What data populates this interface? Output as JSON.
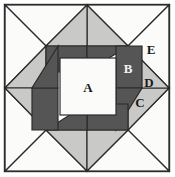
{
  "figure": {
    "name": "quilt-block-diagram",
    "width": 175,
    "height": 177,
    "background": "#ffffff"
  },
  "palette": {
    "background": "#ffffff",
    "white_patch": "#fbfbfa",
    "light_gray_patch": "#c9c9c7",
    "dark_gray_patch": "#555555",
    "outline": "#2b2b2b",
    "label_text": "#1a1a1a"
  },
  "frame": {
    "outer_rect": {
      "x": 4,
      "y": 4,
      "width": 166,
      "height": 168
    },
    "stroke_width": 1.4
  },
  "labels": [
    {
      "id": "A",
      "text": "A",
      "x": 88,
      "y": 88,
      "patch": "center-square",
      "color": "#fbfbfa"
    },
    {
      "id": "B",
      "text": "B",
      "x": 128,
      "y": 70,
      "patch": "star-point-bar",
      "color": "#555555"
    },
    {
      "id": "C",
      "text": "C",
      "x": 140,
      "y": 103,
      "patch": "corner-triangle-lower",
      "color": "#c9c9c7"
    },
    {
      "id": "D",
      "text": "D",
      "x": 149,
      "y": 83,
      "patch": "tip-triangle",
      "color": "#c9c9c7"
    },
    {
      "id": "E",
      "text": "E",
      "x": 151,
      "y": 51,
      "patch": "background-triangle",
      "color": "#fbfbfa"
    }
  ],
  "geometry": {
    "description": "Four-fold rotationally symmetric star / pinwheel block",
    "center": {
      "x": 87.5,
      "y": 88.5
    },
    "center_square": {
      "x": 60,
      "y": 58,
      "width": 56,
      "height": 57
    },
    "edge_midpoints": {
      "top": {
        "x": 87,
        "y": 5
      },
      "right": {
        "x": 169,
        "y": 88
      },
      "bottom": {
        "x": 87,
        "y": 171
      },
      "left": {
        "x": 5,
        "y": 88
      }
    },
    "corners": {
      "top_left": {
        "x": 5,
        "y": 5
      },
      "top_right": {
        "x": 169,
        "y": 5
      },
      "bottom_right": {
        "x": 169,
        "y": 171
      },
      "bottom_left": {
        "x": 5,
        "y": 171
      }
    }
  },
  "patches": {
    "white_count": 5,
    "light_gray_count": 8,
    "dark_gray_count": 8,
    "labeled_pieces": [
      "A",
      "B",
      "C",
      "D",
      "E"
    ]
  }
}
